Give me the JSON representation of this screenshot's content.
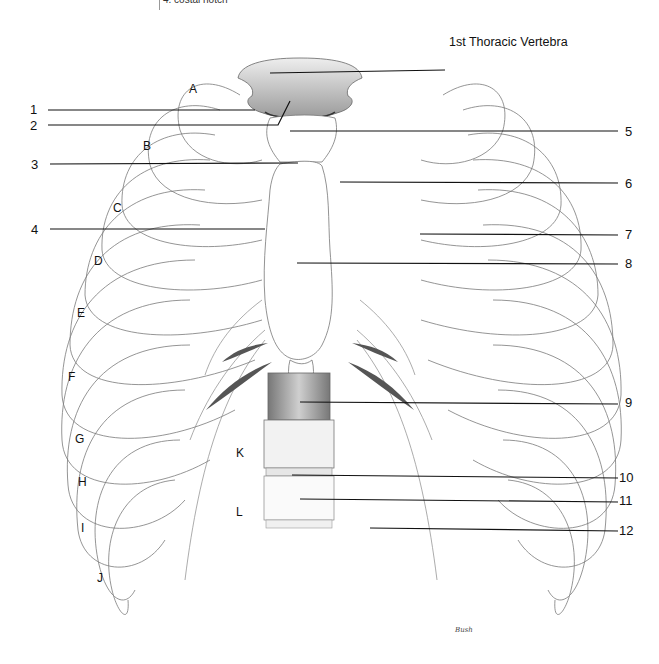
{
  "diagram": {
    "top_note": "4. costal notch",
    "title_label": "1st Thoracic Vertebra",
    "signature": "Bush",
    "left_numbers": [
      {
        "id": "1",
        "y": 109
      },
      {
        "id": "2",
        "y": 125
      },
      {
        "id": "3",
        "y": 164
      },
      {
        "id": "4",
        "y": 229
      }
    ],
    "right_numbers": [
      {
        "id": "5",
        "y": 131
      },
      {
        "id": "6",
        "y": 184
      },
      {
        "id": "7",
        "y": 235
      },
      {
        "id": "8",
        "y": 264
      },
      {
        "id": "9",
        "y": 402
      },
      {
        "id": "10",
        "y": 477
      },
      {
        "id": "11",
        "y": 500
      },
      {
        "id": "12",
        "y": 530
      }
    ],
    "rib_letters": [
      {
        "id": "A",
        "x": 189,
        "y": 83
      },
      {
        "id": "B",
        "x": 143,
        "y": 140
      },
      {
        "id": "C",
        "x": 113,
        "y": 202
      },
      {
        "id": "D",
        "x": 94,
        "y": 255
      },
      {
        "id": "E",
        "x": 77,
        "y": 307
      },
      {
        "id": "F",
        "x": 68,
        "y": 371
      },
      {
        "id": "G",
        "x": 75,
        "y": 433
      },
      {
        "id": "H",
        "x": 78,
        "y": 476
      },
      {
        "id": "I",
        "x": 81,
        "y": 522
      },
      {
        "id": "J",
        "x": 97,
        "y": 572
      },
      {
        "id": "K",
        "x": 236,
        "y": 447
      },
      {
        "id": "L",
        "x": 236,
        "y": 506
      }
    ],
    "colors": {
      "background": "#ffffff",
      "ink": "#111111",
      "pencil": "#6b6b6b",
      "shade": "#9a9a9a"
    }
  }
}
